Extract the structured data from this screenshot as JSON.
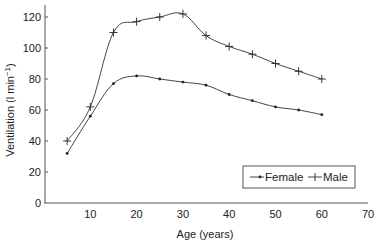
{
  "chart_data": {
    "type": "line",
    "title": "",
    "xlabel": "Age (years)",
    "ylabel": "Ventilation (l min",
    "ylabel_superscript": "−1",
    "ylabel_suffix": ")",
    "xlim": [
      0,
      70
    ],
    "ylim": [
      0,
      125
    ],
    "xticks": [
      10,
      20,
      30,
      40,
      50,
      60,
      70
    ],
    "yticks": [
      0,
      20,
      40,
      60,
      80,
      100,
      120
    ],
    "grid": false,
    "legend_position": "bottom-right",
    "x": [
      5,
      10,
      15,
      20,
      25,
      30,
      35,
      40,
      45,
      50,
      55,
      60
    ],
    "series": [
      {
        "name": "Female",
        "marker": "dot",
        "values": [
          32,
          56,
          77,
          82,
          80,
          78,
          76,
          70,
          66,
          62,
          60,
          57
        ]
      },
      {
        "name": "Male",
        "marker": "plus",
        "values": [
          40,
          62,
          110,
          117,
          120,
          122,
          108,
          101,
          96,
          90,
          85,
          80
        ]
      }
    ]
  }
}
